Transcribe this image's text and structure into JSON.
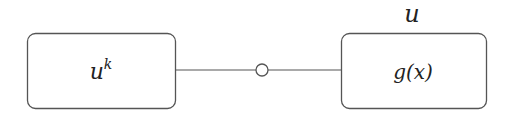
{
  "diagram": {
    "nodes": [
      {
        "id": "left",
        "label_base": "u",
        "label_sup": "k"
      },
      {
        "id": "right",
        "label": "g(x)",
        "above_label": "u"
      }
    ],
    "edges": [
      {
        "from": "left",
        "to": "right",
        "marker": "open-circle-midpoint"
      }
    ],
    "colors": {
      "stroke": "#555555",
      "text": "#222222",
      "background": "#ffffff"
    }
  }
}
